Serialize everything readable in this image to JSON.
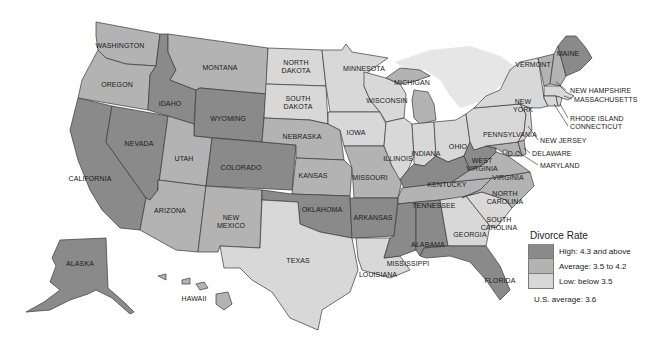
{
  "map": {
    "title": "Divorce Rate by State",
    "colors": {
      "high": "#8a8a8a",
      "average": "#b3b3b3",
      "low": "#d8d8d8",
      "lake": "#e6e6e6",
      "border": "#3a3a3a"
    },
    "states": {
      "WA": {
        "name": "WASHINGTON",
        "category": "average"
      },
      "OR": {
        "name": "OREGON",
        "category": "average"
      },
      "CA": {
        "name": "CALIFORNIA",
        "category": "high"
      },
      "NV": {
        "name": "NEVADA",
        "category": "high"
      },
      "ID": {
        "name": "IDAHO",
        "category": "high"
      },
      "MT": {
        "name": "MONTANA",
        "category": "average"
      },
      "WY": {
        "name": "WYOMING",
        "category": "high"
      },
      "UT": {
        "name": "UTAH",
        "category": "average"
      },
      "CO": {
        "name": "COLORADO",
        "category": "high"
      },
      "AZ": {
        "name": "ARIZONA",
        "category": "average"
      },
      "NM": {
        "name": "NEW MEXICO",
        "category": "average"
      },
      "ND": {
        "name": "NORTH DAKOTA",
        "category": "low"
      },
      "SD": {
        "name": "SOUTH DAKOTA",
        "category": "low"
      },
      "NE": {
        "name": "NEBRASKA",
        "category": "average"
      },
      "KS": {
        "name": "KANSAS",
        "category": "average"
      },
      "OK": {
        "name": "OKLAHOMA",
        "category": "high"
      },
      "TX": {
        "name": "TEXAS",
        "category": "low"
      },
      "MN": {
        "name": "MINNESOTA",
        "category": "low"
      },
      "IA": {
        "name": "IOWA",
        "category": "low"
      },
      "MO": {
        "name": "MISSOURI",
        "category": "average"
      },
      "AR": {
        "name": "ARKANSAS",
        "category": "high"
      },
      "LA": {
        "name": "LOUISIANA",
        "category": "low"
      },
      "WI": {
        "name": "WISCONSIN",
        "category": "low"
      },
      "IL": {
        "name": "ILLINOIS",
        "category": "low"
      },
      "MI": {
        "name": "MICHIGAN",
        "category": "average"
      },
      "IN": {
        "name": "INDIANA",
        "category": "low"
      },
      "OH": {
        "name": "OHIO",
        "category": "low"
      },
      "KY": {
        "name": "KENTUCKY",
        "category": "high"
      },
      "TN": {
        "name": "TENNESSEE",
        "category": "average"
      },
      "MS": {
        "name": "MISSISSIPPI",
        "category": "high"
      },
      "AL": {
        "name": "ALABAMA",
        "category": "high"
      },
      "GA": {
        "name": "GEORGIA",
        "category": "low"
      },
      "FL": {
        "name": "FLORIDA",
        "category": "high"
      },
      "SC": {
        "name": "SOUTH CAROLINA",
        "category": "low"
      },
      "NC": {
        "name": "NORTH CAROLINA",
        "category": "average"
      },
      "VA": {
        "name": "VIRGINIA",
        "category": "average"
      },
      "WV": {
        "name": "WEST VIRGINIA",
        "category": "high"
      },
      "PA": {
        "name": "PENNSYLVANIA",
        "category": "low"
      },
      "NY": {
        "name": "NEW YORK",
        "category": "low"
      },
      "VT": {
        "name": "VERMONT",
        "category": "average"
      },
      "NH": {
        "name": "NEW HAMPSHIRE",
        "category": "average"
      },
      "ME": {
        "name": "MAINE",
        "category": "high"
      },
      "MA": {
        "name": "MASSACHUSETTS",
        "category": "low"
      },
      "RI": {
        "name": "RHODE ISLAND",
        "category": "low"
      },
      "CT": {
        "name": "CONNECTICUT",
        "category": "low"
      },
      "NJ": {
        "name": "NEW JERSEY",
        "category": "low"
      },
      "DE": {
        "name": "DELAWARE",
        "category": "average"
      },
      "MD": {
        "name": "MARYLAND",
        "category": "average"
      },
      "DC": {
        "name": "D.C.",
        "category": "low"
      },
      "AK": {
        "name": "ALASKA",
        "category": "high"
      },
      "HI": {
        "name": "HAWAII",
        "category": "average"
      }
    },
    "labels": {
      "WA": "WASHINGTON",
      "OR": "OREGON",
      "CA": "CALIFORNIA",
      "NV": "NEVADA",
      "ID": "IDAHO",
      "MT": "MONTANA",
      "WY": "WYOMING",
      "UT": "UTAH",
      "CO": "COLORADO",
      "AZ": "ARIZONA",
      "NM1": "NEW",
      "NM2": "MEXICO",
      "ND1": "NORTH",
      "ND2": "DAKOTA",
      "SD1": "SOUTH",
      "SD2": "DAKOTA",
      "NE": "NEBRASKA",
      "KS": "KANSAS",
      "OK": "OKLAHOMA",
      "TX": "TEXAS",
      "MN": "MINNESOTA",
      "IA": "IOWA",
      "MO": "MISSOURI",
      "AR": "ARKANSAS",
      "LA": "LOUISIANA",
      "WI": "WISCONSIN",
      "IL": "ILLINOIS",
      "MI": "MICHIGAN",
      "IN": "INDIANA",
      "OH": "OHIO",
      "KY": "KENTUCKY",
      "TN": "TENNESSEE",
      "MS": "MISSISSIPPI",
      "AL": "ALABAMA",
      "GA": "GEORGIA",
      "FL": "FLORIDA",
      "SC1": "SOUTH",
      "SC2": "CAROLINA",
      "NC1": "NORTH",
      "NC2": "CAROLINA",
      "VA": "VIRGINIA",
      "WV1": "WEST",
      "WV2": "VIRGINIA",
      "PA": "PENNSYLVANIA",
      "NY1": "NEW",
      "NY2": "YORK",
      "VT": "VERMONT",
      "NH": "NEW HAMPSHIRE",
      "ME": "MAINE",
      "MA": "MASSACHUSETTS",
      "RI": "RHODE ISLAND",
      "CT": "CONNECTICUT",
      "NJ": "NEW JERSEY",
      "DE": "DELAWARE",
      "MD": "MARYLAND",
      "DC": "D.C.",
      "AK": "ALASKA",
      "HI": "HAWAII"
    }
  },
  "legend": {
    "title": "Divorce Rate",
    "items": [
      {
        "label": "High: 4.3 and above",
        "color": "#8a8a8a"
      },
      {
        "label": "Average: 3.5 to 4.2",
        "color": "#b3b3b3"
      },
      {
        "label": "Low: below 3.5",
        "color": "#d8d8d8"
      }
    ],
    "us_average": "U.S. average: 3.6"
  }
}
